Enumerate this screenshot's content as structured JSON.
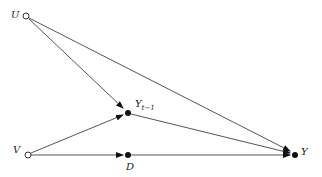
{
  "diagram": {
    "nodes": [
      {
        "id": "U",
        "label": "U",
        "x": 26,
        "y": 16,
        "style": "hollow"
      },
      {
        "id": "V",
        "label": "V",
        "x": 28,
        "y": 155,
        "style": "hollow"
      },
      {
        "id": "Ylag",
        "label": "Y",
        "subscript": "t−1",
        "x": 128,
        "y": 113,
        "style": "filled"
      },
      {
        "id": "D",
        "label": "D",
        "x": 128,
        "y": 155,
        "style": "filled"
      },
      {
        "id": "Y",
        "label": "Y",
        "x": 295,
        "y": 155,
        "style": "filled"
      }
    ],
    "edges": [
      {
        "from": "U",
        "to": "Ylag"
      },
      {
        "from": "U",
        "to": "Y"
      },
      {
        "from": "V",
        "to": "Ylag"
      },
      {
        "from": "V",
        "to": "D"
      },
      {
        "from": "Ylag",
        "to": "Y"
      },
      {
        "from": "D",
        "to": "Y"
      }
    ],
    "colors": {
      "edge": "#555555",
      "node": "#111111"
    }
  }
}
